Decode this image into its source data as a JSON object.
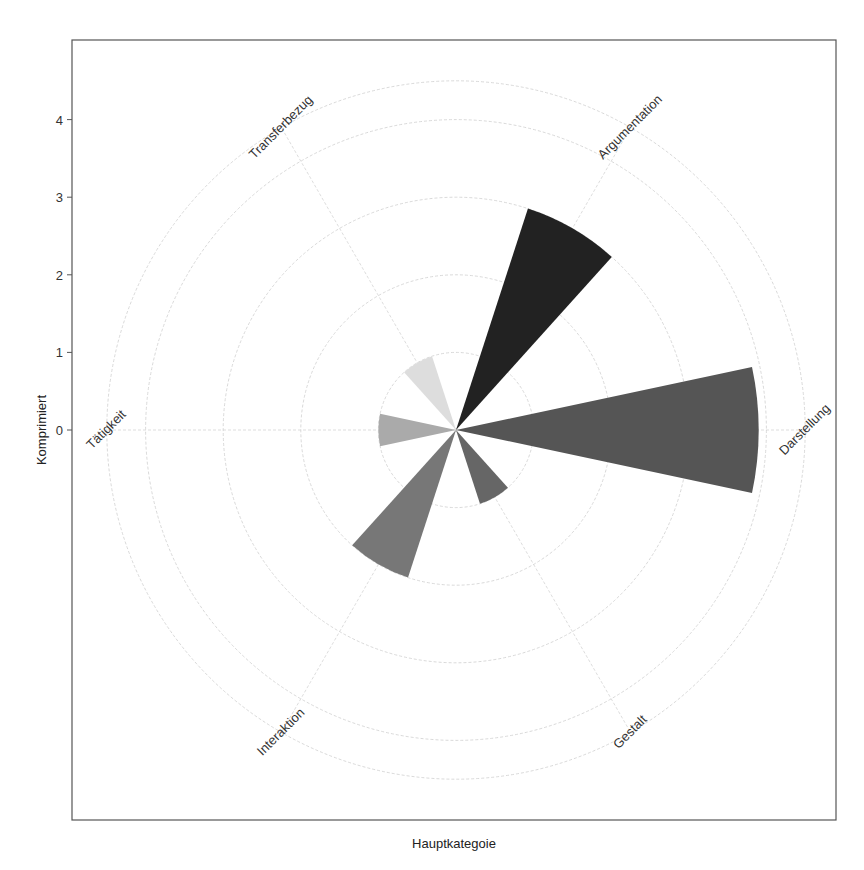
{
  "chart_data": {
    "type": "polar-bar",
    "title": "",
    "xlabel": "Hauptkategoie",
    "ylabel": "Komprimiert",
    "categories": [
      "Darstellung",
      "Argumentation",
      "Transferbezug",
      "Tätigkeit",
      "Interaktion",
      "Gestalt"
    ],
    "values": [
      3.9,
      3.0,
      1.0,
      1.0,
      2.0,
      1.0
    ],
    "angles_deg": [
      0,
      60,
      120,
      180,
      240,
      300
    ],
    "colors": [
      "#555555",
      "#222222",
      "#dddddd",
      "#aaaaaa",
      "#777777",
      "#666666"
    ],
    "radial_ticks": [
      0,
      1,
      2,
      3,
      4
    ],
    "rings": [
      1,
      2,
      3,
      4,
      4.5
    ],
    "ylim": [
      0,
      4.5
    ],
    "grid": true,
    "legend": "none"
  },
  "axes": {
    "x_title": "Hauptkategoie",
    "y_title": "Komprimiert",
    "y_tick_labels": [
      "0",
      "1",
      "2",
      "3",
      "4"
    ]
  }
}
